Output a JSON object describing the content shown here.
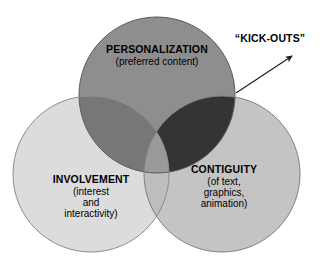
{
  "diagram": {
    "type": "venn-3-circle",
    "background_color": "#ffffff",
    "title_annotation": {
      "text": "“KICK-OUTS”",
      "points_to": "overlap of PERSONALIZATION and CONTIGUITY"
    },
    "sets": [
      {
        "id": "personalization",
        "title": "PERSONALIZATION",
        "subtitle_lines": [
          "(preferred content)"
        ],
        "fill_color": "#8e8e8e",
        "stroke_color": "#5a5a5a",
        "cx": 157,
        "cy": 95,
        "r": 78
      },
      {
        "id": "involvement",
        "title": "INVOLVEMENT",
        "subtitle_lines": [
          "(interest",
          "and",
          "interactivity)"
        ],
        "fill_color": "#dcdcdc",
        "stroke_color": "#8c8c8c",
        "cx": 91,
        "cy": 174,
        "r": 78
      },
      {
        "id": "contiguity",
        "title": "CONTIGUITY",
        "subtitle_lines": [
          "(of text,",
          "graphics,",
          "animation)"
        ],
        "fill_color": "#c4c4c4",
        "stroke_color": "#808080",
        "cx": 222,
        "cy": 174,
        "r": 78
      }
    ],
    "overlaps": [
      {
        "id": "personalization-involvement",
        "members": [
          "personalization",
          "involvement"
        ],
        "fill_color": "#777777"
      },
      {
        "id": "personalization-contiguity",
        "members": [
          "personalization",
          "contiguity"
        ],
        "fill_color": "#343434",
        "note": "KICK-OUTS region"
      },
      {
        "id": "involvement-contiguity",
        "members": [
          "involvement",
          "contiguity"
        ],
        "fill_color": "#bdbdbd"
      },
      {
        "id": "all-three",
        "members": [
          "personalization",
          "involvement",
          "contiguity"
        ],
        "fill_color": "#9a9a9a"
      }
    ],
    "arrow": {
      "id": "kickouts-arrow",
      "color": "#1a1a1a",
      "from_x": 236,
      "from_y": 93,
      "to_x": 292,
      "to_y": 56
    }
  }
}
